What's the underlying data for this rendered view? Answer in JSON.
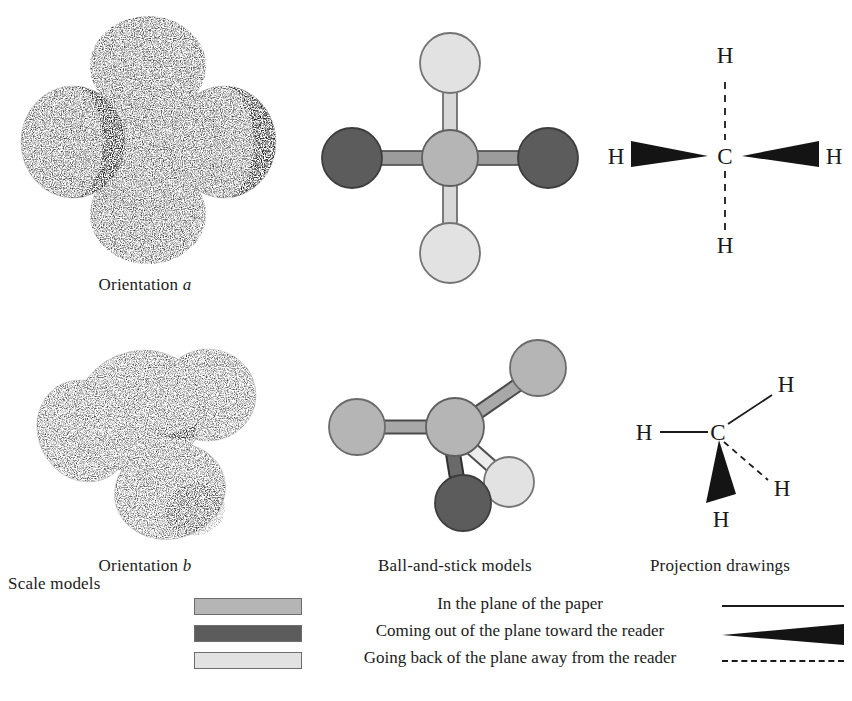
{
  "figure": {
    "molecule": "methane",
    "formula": "CH4",
    "column_labels": {
      "scale_models": "Scale models",
      "ball_and_stick": "Ball-and-stick models",
      "projection": "Projection drawings"
    },
    "row_labels": {
      "orientation_a_prefix": "Orientation",
      "orientation_a_letter": "a",
      "orientation_b_prefix": "Orientation",
      "orientation_b_letter": "b"
    }
  },
  "colors": {
    "in_plane": "#b5b5b5",
    "toward_reader": "#5c5c5c",
    "away_from_reader": "#e2e2e2",
    "outline": "#6d6d6d",
    "ink": "#1a1a1a",
    "background": "#ffffff",
    "stipple": "#8a8a8a"
  },
  "atoms": {
    "carbon_symbol": "C",
    "hydrogen_symbol": "H"
  },
  "models": {
    "ball_stick_a": {
      "center": {
        "cx": 450,
        "cy": 158,
        "r": 27,
        "shade": "in_plane"
      },
      "balls": [
        {
          "id": "top",
          "cx": 450,
          "cy": 63,
          "r": 30,
          "shade": "away_from_reader"
        },
        {
          "id": "bottom",
          "cx": 450,
          "cy": 253,
          "r": 30,
          "shade": "away_from_reader"
        },
        {
          "id": "left",
          "cx": 352,
          "cy": 158,
          "r": 30,
          "shade": "toward_reader"
        },
        {
          "id": "right",
          "cx": 548,
          "cy": 158,
          "r": 30,
          "shade": "toward_reader"
        }
      ]
    },
    "ball_stick_b": {
      "center": {
        "cx": 455,
        "cy": 427,
        "r": 28,
        "shade": "in_plane"
      },
      "balls": [
        {
          "id": "upper-right",
          "cx": 538,
          "cy": 368,
          "r": 28,
          "shade": "in_plane"
        },
        {
          "id": "left",
          "cx": 357,
          "cy": 427,
          "r": 28,
          "shade": "in_plane"
        },
        {
          "id": "front",
          "cx": 463,
          "cy": 500,
          "r": 28,
          "shade": "toward_reader"
        },
        {
          "id": "back",
          "cx": 509,
          "cy": 482,
          "r": 25,
          "shade": "away_from_reader"
        }
      ]
    }
  },
  "projections": {
    "a": {
      "carbon": {
        "x": 725,
        "y": 156,
        "label": "C"
      },
      "hydrogens": [
        {
          "label": "H",
          "x": 725,
          "y": 67,
          "bond": "dashed"
        },
        {
          "label": "H",
          "x": 725,
          "y": 246,
          "bond": "dashed"
        },
        {
          "label": "H",
          "x": 624,
          "y": 156,
          "bond": "wedge"
        },
        {
          "label": "H",
          "x": 826,
          "y": 156,
          "bond": "wedge"
        }
      ]
    },
    "b": {
      "carbon": {
        "x": 718,
        "y": 432,
        "label": "C"
      },
      "hydrogens": [
        {
          "label": "H",
          "x": 648,
          "y": 432,
          "bond": "plain"
        },
        {
          "label": "H",
          "x": 783,
          "y": 393,
          "bond": "plain"
        },
        {
          "label": "H",
          "x": 740,
          "y": 510,
          "bond": "wedge"
        },
        {
          "label": "H",
          "x": 775,
          "y": 487,
          "bond": "dashed"
        }
      ]
    }
  },
  "legend": {
    "rows": [
      {
        "swatch_shade": "in_plane",
        "text": "In the plane of the paper",
        "symbol": "plain-line"
      },
      {
        "swatch_shade": "toward_reader",
        "text": "Coming out of the plane toward the reader",
        "symbol": "solid-wedge"
      },
      {
        "swatch_shade": "away_from_reader",
        "text": "Going back of the plane away from the reader",
        "symbol": "dashed-line"
      }
    ]
  }
}
